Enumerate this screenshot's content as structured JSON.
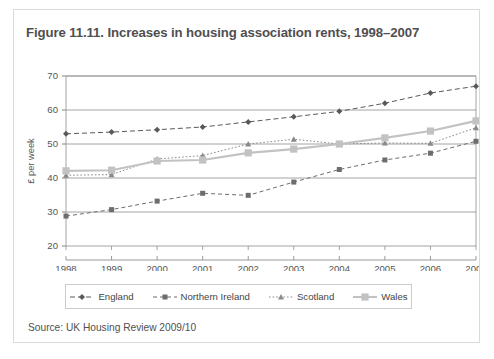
{
  "figure": {
    "title": "Figure 11.11. Increases in housing association rents, 1998–2007",
    "source": "Source: UK Housing Review 2009/10"
  },
  "legend": {
    "items": [
      {
        "label": "England",
        "icon": "diamond-marker-dashed-line",
        "marker": "diamond",
        "dash": "5,3",
        "color": "#595959",
        "width": 1
      },
      {
        "label": "Northern Ireland",
        "icon": "square-marker-dashed-line",
        "marker": "square",
        "dash": "4,3",
        "color": "#6d6d6d",
        "width": 1
      },
      {
        "label": "Scotland",
        "icon": "triangle-marker-dotted-line",
        "marker": "triangle",
        "dash": "1.6,2",
        "color": "#8a8a8a",
        "width": 1
      },
      {
        "label": "Wales",
        "icon": "square-marker-solid-line",
        "marker": "square",
        "dash": "0",
        "color": "#c2c2c2",
        "width": 2.1
      }
    ]
  },
  "chart_data": {
    "type": "line",
    "title": "Increases in housing association rents, 1998–2007",
    "xlabel": "",
    "ylabel": "£ per week",
    "categories": [
      "1998",
      "1999",
      "2000",
      "2001",
      "2002",
      "2003",
      "2004",
      "2005",
      "2006",
      "2007"
    ],
    "x": [
      1998,
      1999,
      2000,
      2001,
      2002,
      2003,
      2004,
      2005,
      2006,
      2007
    ],
    "ylim": [
      20,
      70
    ],
    "yticks": [
      20,
      30,
      40,
      50,
      60,
      70
    ],
    "grid": true,
    "legend_position": "bottom",
    "series": [
      {
        "name": "England",
        "marker": "diamond",
        "color": "#595959",
        "values": [
          53.0,
          53.5,
          54.2,
          55.0,
          56.5,
          58.0,
          59.6,
          62.0,
          65.0,
          67.0
        ]
      },
      {
        "name": "Northern Ireland",
        "marker": "square",
        "color": "#6d6d6d",
        "values": [
          28.8,
          30.7,
          33.2,
          35.5,
          34.9,
          38.8,
          42.5,
          45.3,
          47.3,
          50.8
        ]
      },
      {
        "name": "Scotland",
        "marker": "triangle",
        "color": "#8a8a8a",
        "values": [
          40.8,
          41.0,
          45.6,
          46.6,
          50.0,
          51.4,
          50.0,
          50.3,
          50.2,
          54.8
        ]
      },
      {
        "name": "Wales",
        "marker": "square",
        "color": "#c2c2c2",
        "values": [
          42.1,
          42.3,
          45.0,
          45.3,
          47.4,
          48.5,
          50.0,
          51.8,
          53.8,
          56.8
        ]
      }
    ]
  }
}
